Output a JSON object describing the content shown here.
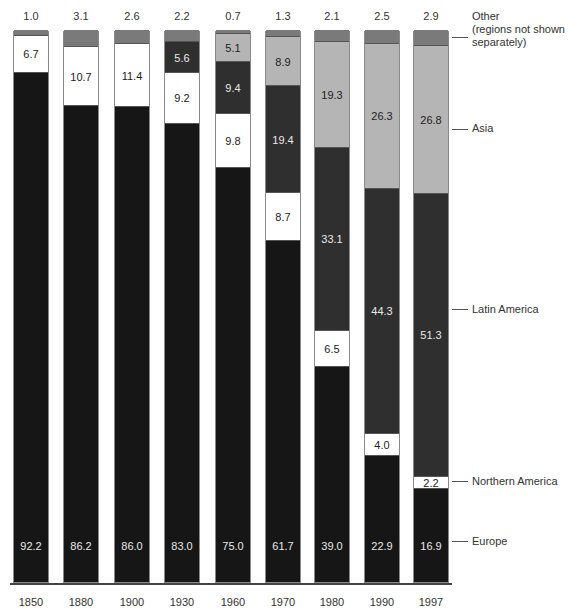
{
  "chart_data": {
    "type": "bar",
    "stacked": true,
    "normalized_percent": true,
    "title": "",
    "xlabel": "",
    "ylabel": "",
    "ylim": [
      0,
      100
    ],
    "grid": false,
    "legend_position": "right (inline labels)",
    "categories": [
      "1850",
      "1880",
      "1900",
      "1930",
      "1960",
      "1970",
      "1980",
      "1990",
      "1997"
    ],
    "series": [
      {
        "name": "Europe",
        "color": "#161616",
        "label_color": "#e8e8e8",
        "values": [
          92.2,
          86.2,
          86.0,
          83.0,
          75.0,
          61.7,
          39.0,
          22.9,
          16.9
        ]
      },
      {
        "name": "Northern America",
        "color": "#ffffff",
        "label_color": "#222222",
        "values": [
          6.7,
          10.7,
          11.4,
          9.2,
          9.8,
          8.7,
          6.5,
          4.0,
          2.2
        ]
      },
      {
        "name": "Latin America",
        "color": "#2f2f2f",
        "label_color": "#e8e8e8",
        "values": [
          0,
          0,
          0,
          5.6,
          9.4,
          19.4,
          33.1,
          44.3,
          51.3
        ]
      },
      {
        "name": "Asia",
        "color": "#b5b5b5",
        "label_color": "#222222",
        "values": [
          0,
          0,
          0,
          0,
          5.1,
          8.9,
          19.3,
          26.3,
          26.8
        ]
      },
      {
        "name": "Other (regions not shown separately)",
        "color": "#7a7a7a",
        "label_color": "#222222",
        "values": [
          1.0,
          3.1,
          2.6,
          2.2,
          0.7,
          1.3,
          2.1,
          2.5,
          2.9
        ]
      }
    ],
    "top_labels": [
      "1.0",
      "3.1",
      "2.6",
      "2.2",
      "0.7",
      "1.3",
      "2.1",
      "2.5",
      "2.9"
    ],
    "legend": [
      {
        "series": "Other",
        "text": "Other\n(regions not shown\nseparately)"
      },
      {
        "series": "Asia",
        "text": "Asia"
      },
      {
        "series": "Latin America",
        "text": "Latin America"
      },
      {
        "series": "Northern America",
        "text": "Northern America"
      },
      {
        "series": "Europe",
        "text": "Europe"
      }
    ]
  }
}
